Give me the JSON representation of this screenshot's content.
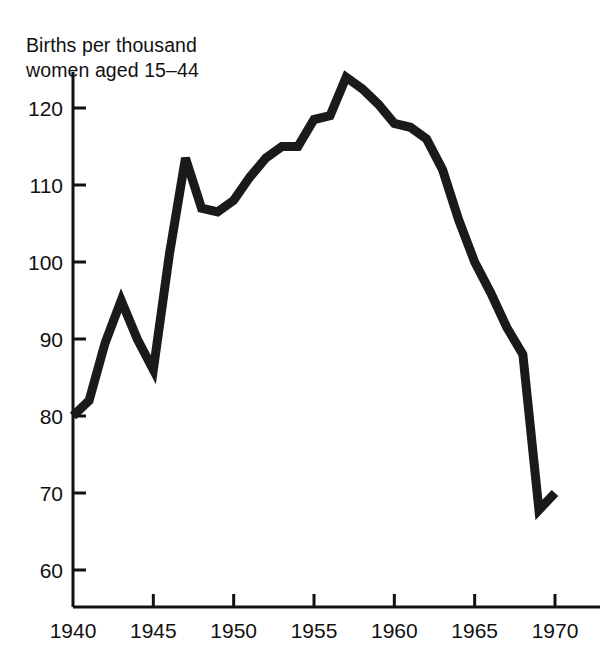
{
  "chart_data": {
    "type": "line",
    "title": "",
    "ylabel": "Births per thousand women aged 15–44",
    "ylabel_line1": "Births per thousand",
    "ylabel_line2": "women aged 15–44",
    "xlabel": "",
    "xlim": [
      1940,
      1971
    ],
    "ylim": [
      55.2,
      127
    ],
    "grid": false,
    "legend": "none",
    "line_color": "#1a1a1a",
    "line_width_px": 9,
    "background_color": "#ffffff",
    "axis_color": "#111111",
    "x": [
      1940,
      1941,
      1942,
      1943,
      1944,
      1945,
      1946,
      1947,
      1948,
      1949,
      1950,
      1951,
      1952,
      1953,
      1954,
      1955,
      1956,
      1957,
      1958,
      1959,
      1960,
      1961,
      1962,
      1963,
      1964,
      1965,
      1966,
      1967,
      1968,
      1969,
      1970
    ],
    "values": [
      80,
      82,
      89.5,
      95,
      90,
      86,
      101,
      113.5,
      107,
      106.5,
      108,
      111,
      113.5,
      115,
      115,
      118.5,
      119,
      124,
      122.5,
      120.5,
      118,
      117.5,
      116,
      112,
      105.5,
      100,
      96,
      91.5,
      88,
      67.8,
      70
    ],
    "series": [
      {
        "name": "Births per thousand women aged 15-44",
        "values": [
          80,
          82,
          89.5,
          95,
          90,
          86,
          101,
          113.5,
          107,
          106.5,
          108,
          111,
          113.5,
          115,
          115,
          118.5,
          119,
          124,
          122.5,
          120.5,
          118,
          117.5,
          116,
          112,
          105.5,
          100,
          96,
          91.5,
          88,
          67.8,
          70
        ]
      }
    ],
    "yticks": [
      60,
      70,
      80,
      90,
      100,
      110,
      120
    ],
    "ytick_labels": [
      "60",
      "70",
      "80",
      "90",
      "100",
      "110",
      "120"
    ],
    "xticks": [
      1940,
      1945,
      1950,
      1955,
      1960,
      1965,
      1970
    ],
    "xtick_labels": [
      "1940",
      "1945",
      "1950",
      "1955",
      "1960",
      "1965",
      "1970"
    ]
  }
}
